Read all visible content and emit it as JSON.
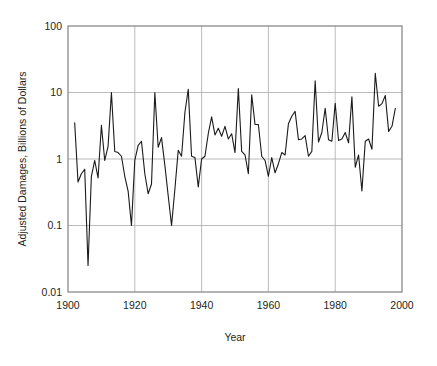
{
  "chart_data": {
    "type": "line",
    "title": "",
    "xlabel": "Year",
    "ylabel": "Adjusted Damages, Billions of Dollars",
    "xlim": [
      1900,
      2000
    ],
    "ylim": [
      0.01,
      100
    ],
    "yscale": "log",
    "grid": true,
    "legend": "none",
    "line_color": "#1a1a1a",
    "axis_color": "#808080",
    "grid_color": "#b3b3b3",
    "background_color": "#ffffff",
    "xticks": [
      1900,
      1920,
      1940,
      1960,
      1980,
      2000
    ],
    "xtick_labels": [
      "1900",
      "1920",
      "1940",
      "1960",
      "1980",
      "2000"
    ],
    "yticks": [
      0.01,
      0.1,
      1,
      10,
      100
    ],
    "ytick_labels": [
      "0.01",
      "0.1",
      "1",
      "10",
      "100"
    ],
    "x": [
      1902,
      1903,
      1904,
      1905,
      1906,
      1907,
      1908,
      1909,
      1910,
      1911,
      1912,
      1913,
      1914,
      1915,
      1916,
      1917,
      1918,
      1919,
      1920,
      1921,
      1922,
      1923,
      1924,
      1925,
      1926,
      1927,
      1928,
      1929,
      1930,
      1931,
      1932,
      1933,
      1934,
      1935,
      1936,
      1937,
      1938,
      1939,
      1940,
      1941,
      1942,
      1943,
      1944,
      1945,
      1946,
      1947,
      1948,
      1949,
      1950,
      1951,
      1952,
      1953,
      1954,
      1955,
      1956,
      1957,
      1958,
      1959,
      1960,
      1961,
      1962,
      1963,
      1964,
      1965,
      1966,
      1967,
      1968,
      1969,
      1970,
      1971,
      1972,
      1973,
      1974,
      1975,
      1976,
      1977,
      1978,
      1979,
      1980,
      1981,
      1982,
      1983,
      1984,
      1985,
      1986,
      1987,
      1988,
      1989,
      1990,
      1991,
      1992,
      1993,
      1994,
      1995,
      1996,
      1997,
      1998
    ],
    "values": [
      3.5,
      0.45,
      0.6,
      0.7,
      0.025,
      0.55,
      0.95,
      0.52,
      3.2,
      0.95,
      1.55,
      10.0,
      1.3,
      1.25,
      1.1,
      0.55,
      0.33,
      0.1,
      0.95,
      1.6,
      1.85,
      0.6,
      0.3,
      0.42,
      10.0,
      1.5,
      2.1,
      0.8,
      0.28,
      0.1,
      0.35,
      1.35,
      1.1,
      5.0,
      11.2,
      1.1,
      1.05,
      0.38,
      1.0,
      1.1,
      2.4,
      4.3,
      2.3,
      2.9,
      2.2,
      3.1,
      2.0,
      2.4,
      1.25,
      11.5,
      1.3,
      1.15,
      0.6,
      9.2,
      3.3,
      3.3,
      1.1,
      0.95,
      0.55,
      1.05,
      0.62,
      0.85,
      1.25,
      1.15,
      3.4,
      4.4,
      5.2,
      1.95,
      2.0,
      2.25,
      1.1,
      1.3,
      15.0,
      1.8,
      2.5,
      5.8,
      1.95,
      1.85,
      6.9,
      1.9,
      2.0,
      2.5,
      1.75,
      8.6,
      0.75,
      1.15,
      0.33,
      1.85,
      2.0,
      1.4,
      19.5,
      6.2,
      6.8,
      9.0,
      2.6,
      3.1,
      5.8
    ]
  },
  "axes": {
    "x_axis_title": "Year",
    "y_axis_title": "Adjusted Damages, Billions of Dollars"
  }
}
